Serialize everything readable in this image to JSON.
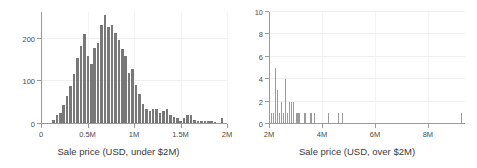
{
  "figure": {
    "background": "#ffffff",
    "bar_color_left": "#787878",
    "bar_color_right": "#9b9b9b",
    "axis_color": "#9a9a9a",
    "grid_color": "#f0eeee"
  },
  "chart_data": [
    {
      "type": "bar",
      "id": "under-2m",
      "title": "",
      "xlabel": "Sale price (USD, under $2M)",
      "ylabel": "",
      "xlim": [
        0,
        2000000
      ],
      "ylim": [
        0,
        262
      ],
      "grid": true,
      "legend": "none",
      "xticks": [
        0,
        500000,
        1000000,
        1500000,
        2000000
      ],
      "xticklabels": [
        "0",
        "0.5M",
        "1M",
        "1.5M",
        "2M"
      ],
      "yticks": [
        0,
        100,
        200
      ],
      "yticklabels": [
        "0",
        "100",
        "200"
      ],
      "bin_width": 37000,
      "bin_starts": [
        120000,
        157000,
        194000,
        231000,
        268000,
        305000,
        342000,
        379000,
        416000,
        453000,
        490000,
        527000,
        564000,
        601000,
        638000,
        675000,
        712000,
        749000,
        786000,
        823000,
        860000,
        897000,
        934000,
        971000,
        1008000,
        1045000,
        1082000,
        1119000,
        1156000,
        1193000,
        1230000,
        1267000,
        1304000,
        1341000,
        1378000,
        1415000,
        1452000,
        1489000,
        1526000,
        1563000,
        1600000,
        1637000,
        1674000,
        1711000,
        1748000,
        1785000,
        1822000,
        1859000,
        1896000,
        1933000
      ],
      "values": [
        10,
        22,
        26,
        44,
        66,
        90,
        118,
        155,
        182,
        210,
        158,
        140,
        178,
        190,
        232,
        255,
        228,
        232,
        212,
        196,
        176,
        158,
        120,
        128,
        92,
        70,
        46,
        36,
        30,
        34,
        34,
        26,
        30,
        36,
        22,
        16,
        14,
        6,
        14,
        20,
        22,
        10,
        6,
        6,
        8,
        6,
        6,
        4,
        2,
        14
      ]
    },
    {
      "type": "bar",
      "id": "over-2m",
      "title": "",
      "xlabel": "Sale price (USD, over $2M)",
      "ylabel": "",
      "xlim": [
        2000000,
        9400000
      ],
      "ylim": [
        0,
        10
      ],
      "grid": true,
      "legend": "none",
      "xticks": [
        2000000,
        4000000,
        6000000,
        8000000
      ],
      "xticklabels": [
        "2M",
        "4M",
        "6M",
        "8M"
      ],
      "yticks": [
        0,
        2,
        4,
        6,
        8,
        10
      ],
      "yticklabels": [
        "0",
        "2",
        "4",
        "6",
        "8",
        "10"
      ],
      "bin_width": 74000,
      "bin_starts": [
        2000000,
        2074000,
        2148000,
        2222000,
        2296000,
        2370000,
        2444000,
        2518000,
        2592000,
        2666000,
        2740000,
        2814000,
        2888000,
        2962000,
        3036000,
        3110000,
        3184000,
        3258000,
        3332000,
        3406000,
        3480000,
        3554000,
        3628000,
        3702000,
        3776000,
        3850000,
        3924000,
        3998000,
        4072000,
        4146000,
        4220000,
        4294000,
        4368000,
        4442000,
        4516000,
        4590000,
        4664000,
        4738000,
        4812000,
        4886000,
        4960000,
        5034000,
        5108000,
        5182000,
        5256000,
        5330000,
        5404000,
        5478000,
        5552000,
        5626000,
        5700000,
        5774000,
        5848000,
        5922000,
        5996000,
        6070000,
        6144000,
        6218000,
        6292000,
        6366000,
        6440000,
        6514000,
        6588000,
        6662000,
        6736000,
        6810000,
        6884000,
        6958000,
        7032000,
        7106000,
        7180000,
        7254000,
        7328000,
        7402000,
        7476000,
        7550000,
        7624000,
        7698000,
        7772000,
        7846000,
        7920000,
        7994000,
        8068000,
        8142000,
        8216000,
        8290000,
        8364000,
        8438000,
        8512000,
        8586000,
        8660000,
        8734000,
        8808000,
        8882000,
        8956000,
        9030000,
        9104000,
        9178000,
        9252000,
        9326000
      ],
      "values": [
        3,
        1,
        1,
        5,
        3,
        1,
        2,
        1,
        4,
        1,
        2,
        2,
        2,
        0,
        1,
        1,
        0,
        0,
        1,
        0,
        0,
        1,
        0,
        1,
        0,
        0,
        0,
        0,
        0,
        0,
        1,
        0,
        0,
        0,
        0,
        1,
        0,
        1,
        0,
        0,
        0,
        0,
        0,
        0,
        0,
        0,
        0,
        0,
        0,
        0,
        0,
        0,
        0,
        0,
        0,
        0,
        0,
        0,
        0,
        0,
        0,
        0,
        0,
        0,
        0,
        0,
        0,
        0,
        0,
        0,
        0,
        0,
        0,
        0,
        0,
        0,
        0,
        0,
        0,
        0,
        0,
        0,
        0,
        0,
        0,
        0,
        0,
        0,
        0,
        0,
        0,
        0,
        0,
        0,
        0,
        0,
        0,
        0,
        1,
        0
      ]
    }
  ]
}
